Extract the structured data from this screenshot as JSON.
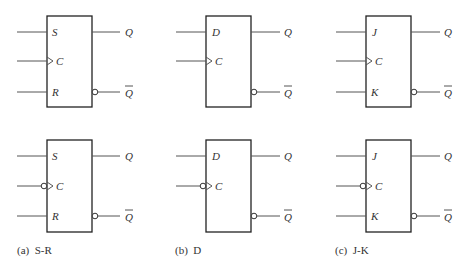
{
  "figure": {
    "panels": [
      {
        "caption": "(a)  S-R",
        "inputs": [
          "S",
          "C",
          "R"
        ],
        "outputs": [
          "Q",
          "Q"
        ],
        "top_clock": "rising-edge",
        "bottom_clock": "falling-edge"
      },
      {
        "caption": "(b)  D",
        "inputs": [
          "D",
          "C"
        ],
        "outputs": [
          "Q",
          "Q"
        ],
        "top_clock": "rising-edge",
        "bottom_clock": "falling-edge"
      },
      {
        "caption": "(c)  J-K",
        "inputs": [
          "J",
          "C",
          "K"
        ],
        "outputs": [
          "Q",
          "Q"
        ],
        "top_clock": "rising-edge",
        "bottom_clock": "falling-edge"
      }
    ]
  },
  "colors": {
    "line": "#333333",
    "background": "#ffffff"
  }
}
